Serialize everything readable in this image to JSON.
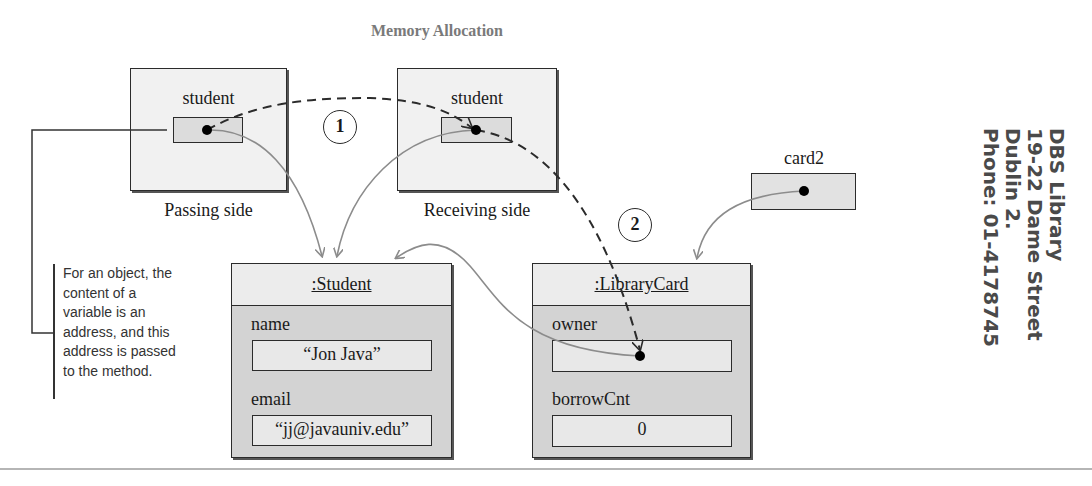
{
  "diagram": {
    "title": "Memory Allocation",
    "passing_side": {
      "caption": "Passing side",
      "variable": "student"
    },
    "receiving_side": {
      "caption": "Receiving side",
      "variable": "student"
    },
    "card2": {
      "variable": "card2"
    },
    "student_object": {
      "header": ":Student",
      "fields": [
        {
          "label": "name",
          "value": "“Jon Java”"
        },
        {
          "label": "email",
          "value": "“jj@javauniv.edu”"
        }
      ]
    },
    "librarycard_object": {
      "header": ":LibraryCard",
      "fields": [
        {
          "label": "owner",
          "value": ""
        },
        {
          "label": "borrowCnt",
          "value": "0"
        }
      ]
    },
    "steps": [
      "1",
      "2"
    ],
    "annotation": {
      "lines": [
        "For an object, the",
        "content of a",
        "variable is an",
        "address, and this",
        "address is passed",
        "to the method."
      ]
    },
    "colors": {
      "frame_bg": "#f1f1f1",
      "object_bg": "#d3d3d3",
      "reference_arrow": "#8c8c8c",
      "dashed_arrow": "#2b2b2b",
      "title": "#7a7a7a",
      "sidebar_text": "#4a4a4a"
    }
  },
  "sidebar_note": {
    "lines": [
      "DBS Library",
      "19-22 Dame Street",
      "Dublin 2.",
      "Phone: 01-4178745"
    ]
  }
}
